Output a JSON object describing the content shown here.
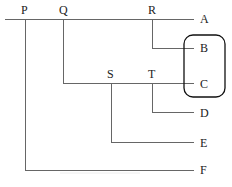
{
  "diagram": {
    "type": "tree-connector-diagram",
    "top_labels": [
      {
        "id": "P",
        "text": "P",
        "x": 21,
        "y": 4
      },
      {
        "id": "Q",
        "text": "Q",
        "x": 59,
        "y": 4
      },
      {
        "id": "R",
        "text": "R",
        "x": 148,
        "y": 4
      },
      {
        "id": "S",
        "text": "S",
        "x": 107,
        "y": 68
      },
      {
        "id": "T",
        "text": "T",
        "x": 148,
        "y": 68
      }
    ],
    "leaf_labels": [
      {
        "id": "A",
        "text": "A",
        "x": 200,
        "y": 13
      },
      {
        "id": "B",
        "text": "B",
        "x": 200,
        "y": 42
      },
      {
        "id": "C",
        "text": "C",
        "x": 200,
        "y": 78
      },
      {
        "id": "D",
        "text": "D",
        "x": 200,
        "y": 107
      },
      {
        "id": "E",
        "text": "E",
        "x": 200,
        "y": 137
      },
      {
        "id": "F",
        "text": "F",
        "x": 200,
        "y": 167
      }
    ],
    "edges": [
      {
        "from": "P",
        "to": "A"
      },
      {
        "from": "R",
        "to": "B"
      },
      {
        "from": "Q",
        "to": "C"
      },
      {
        "from": "T",
        "to": "D"
      },
      {
        "from": "S",
        "to": "E"
      },
      {
        "from": "P",
        "to": "F"
      }
    ],
    "highlight_group": [
      "B",
      "C"
    ],
    "line_color": "#555555",
    "box_color": "#111111"
  }
}
